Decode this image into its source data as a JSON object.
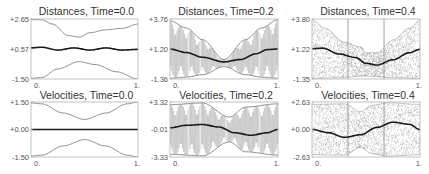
{
  "chart_data": [
    {
      "type": "line",
      "title": "Distances, Time=0.0",
      "xlim": [
        0,
        1
      ],
      "ylim": [
        -1.5,
        2.65
      ],
      "xticks": [
        "0.",
        "1."
      ],
      "yticks": [
        "+2.65",
        "+0.57",
        "-1.50"
      ],
      "yticks_values": [
        2.65,
        0.57,
        -1.5
      ],
      "gridlines_x": [],
      "envelope": {
        "upper": [
          [
            0,
            2.6
          ],
          [
            0.1,
            2.6
          ],
          [
            0.2,
            2.3
          ],
          [
            0.35,
            1.5
          ],
          [
            0.45,
            1.4
          ],
          [
            0.55,
            1.7
          ],
          [
            0.7,
            1.9
          ],
          [
            0.85,
            2.0
          ],
          [
            1,
            2.3
          ]
        ],
        "lower": [
          [
            0,
            -1.45
          ],
          [
            0.1,
            -1.4
          ],
          [
            0.25,
            -0.8
          ],
          [
            0.45,
            -0.3
          ],
          [
            0.6,
            -0.5
          ],
          [
            0.8,
            -1.0
          ],
          [
            1,
            -1.5
          ]
        ]
      },
      "series": [
        {
          "name": "mean",
          "points": [
            [
              0,
              0.65
            ],
            [
              0.1,
              0.7
            ],
            [
              0.25,
              0.5
            ],
            [
              0.4,
              0.65
            ],
            [
              0.55,
              0.5
            ],
            [
              0.7,
              0.65
            ],
            [
              0.85,
              0.5
            ],
            [
              1,
              0.55
            ]
          ]
        }
      ],
      "scatter_density": "none",
      "oscillation": "none"
    },
    {
      "type": "line",
      "title": "Distances, Time=0.2",
      "xlim": [
        0,
        1
      ],
      "ylim": [
        -1.36,
        3.76
      ],
      "xticks": [
        "0.",
        "1."
      ],
      "yticks": [
        "+3.76",
        "+1.20",
        "-1.36"
      ],
      "yticks_values": [
        3.76,
        1.2,
        -1.36
      ],
      "gridlines_x": [],
      "envelope": {
        "upper": [
          [
            0,
            3.6
          ],
          [
            0.15,
            3.0
          ],
          [
            0.3,
            2.0
          ],
          [
            0.5,
            0.3
          ],
          [
            0.7,
            2.0
          ],
          [
            0.85,
            3.0
          ],
          [
            1,
            3.7
          ]
        ],
        "lower": [
          [
            0,
            -1.3
          ],
          [
            0.15,
            -1.2
          ],
          [
            0.3,
            -1.0
          ],
          [
            0.5,
            -0.3
          ],
          [
            0.7,
            -1.0
          ],
          [
            0.85,
            -1.2
          ],
          [
            1,
            -1.3
          ]
        ]
      },
      "series": [
        {
          "name": "mean",
          "points": [
            [
              0,
              1.2
            ],
            [
              0.15,
              0.9
            ],
            [
              0.3,
              0.5
            ],
            [
              0.5,
              0.1
            ],
            [
              0.65,
              0.3
            ],
            [
              0.8,
              0.8
            ],
            [
              0.9,
              1.15
            ],
            [
              1,
              1.2
            ]
          ]
        }
      ],
      "scatter_density": "none",
      "oscillation": "dense"
    },
    {
      "type": "scatter",
      "title": "Distances, Time=0.4",
      "xlim": [
        0,
        1
      ],
      "ylim": [
        -1.35,
        3.8
      ],
      "xticks": [
        "0.",
        "1."
      ],
      "yticks": [
        "+3.80",
        "+1.22",
        "-1.35"
      ],
      "yticks_values": [
        3.8,
        1.22,
        -1.35
      ],
      "gridlines_x": [
        0.333,
        0.667
      ],
      "envelope": {
        "upper": [
          [
            0,
            3.7
          ],
          [
            0.12,
            3.0
          ],
          [
            0.3,
            1.8
          ],
          [
            0.45,
            1.4
          ],
          [
            0.5,
            0.9
          ],
          [
            0.6,
            0.9
          ],
          [
            0.75,
            2.0
          ],
          [
            0.9,
            3.0
          ],
          [
            1,
            3.7
          ]
        ],
        "lower": [
          [
            0,
            -1.3
          ],
          [
            0.2,
            -1.25
          ],
          [
            0.5,
            -1.1
          ],
          [
            0.8,
            -1.25
          ],
          [
            1,
            -1.3
          ]
        ]
      },
      "series": [
        {
          "name": "mean",
          "points": [
            [
              0,
              1.25
            ],
            [
              0.1,
              1.3
            ],
            [
              0.25,
              0.8
            ],
            [
              0.4,
              0.5
            ],
            [
              0.5,
              0.0
            ],
            [
              0.6,
              -0.15
            ],
            [
              0.75,
              0.3
            ],
            [
              0.9,
              0.9
            ],
            [
              1,
              1.2
            ]
          ]
        }
      ],
      "scatter_density": "dense",
      "oscillation": "none"
    },
    {
      "type": "line",
      "title": "Velocities, Time=0.0",
      "xlim": [
        0,
        1
      ],
      "ylim": [
        -1.5,
        1.5
      ],
      "xticks": [
        "0.",
        "1."
      ],
      "yticks": [
        "+1.50",
        "+0.00",
        "-1.50"
      ],
      "yticks_values": [
        1.5,
        0.0,
        -1.5
      ],
      "gridlines_x": [],
      "envelope": {
        "upper": [
          [
            0,
            1.45
          ],
          [
            0.1,
            1.4
          ],
          [
            0.3,
            0.9
          ],
          [
            0.5,
            0.55
          ],
          [
            0.7,
            0.9
          ],
          [
            0.9,
            1.4
          ],
          [
            1,
            1.5
          ]
        ],
        "lower": [
          [
            0,
            -1.45
          ],
          [
            0.1,
            -1.4
          ],
          [
            0.3,
            -0.9
          ],
          [
            0.5,
            -0.55
          ],
          [
            0.7,
            -0.9
          ],
          [
            0.9,
            -1.4
          ],
          [
            1,
            -1.5
          ]
        ]
      },
      "series": [
        {
          "name": "mean",
          "points": [
            [
              0,
              0
            ],
            [
              1,
              0
            ]
          ]
        }
      ],
      "scatter_density": "none",
      "oscillation": "none"
    },
    {
      "type": "line",
      "title": "Velocities, Time=0.2",
      "xlim": [
        0,
        1
      ],
      "ylim": [
        -3.33,
        3.32
      ],
      "xticks": [
        "0.",
        "1."
      ],
      "yticks": [
        "+3.32",
        "-0.01",
        "-3.33"
      ],
      "yticks_values": [
        3.32,
        -0.01,
        -3.33
      ],
      "gridlines_x": [],
      "envelope": {
        "upper": [
          [
            0,
            3.0
          ],
          [
            0.3,
            3.2
          ],
          [
            0.55,
            1.5
          ],
          [
            0.7,
            2.7
          ],
          [
            1,
            3.1
          ]
        ],
        "lower": [
          [
            0,
            -3.0
          ],
          [
            0.3,
            -3.2
          ],
          [
            0.55,
            -1.5
          ],
          [
            0.7,
            -2.7
          ],
          [
            1,
            -3.1
          ]
        ]
      },
      "series": [
        {
          "name": "mean",
          "points": [
            [
              0,
              0.2
            ],
            [
              0.15,
              0.5
            ],
            [
              0.3,
              0.6
            ],
            [
              0.45,
              0.3
            ],
            [
              0.6,
              -0.4
            ],
            [
              0.75,
              -0.7
            ],
            [
              0.9,
              -0.4
            ],
            [
              1,
              0.0
            ]
          ]
        }
      ],
      "scatter_density": "none",
      "oscillation": "dense"
    },
    {
      "type": "scatter",
      "title": "Velocities, Time=0.4",
      "xlim": [
        0,
        1
      ],
      "ylim": [
        -2.63,
        2.63
      ],
      "xticks": [
        "0.",
        "1."
      ],
      "yticks": [
        "+2.63",
        "+0.00",
        "-2.63"
      ],
      "yticks_values": [
        2.63,
        0.0,
        -2.63
      ],
      "gridlines_x": [
        0.333,
        0.667
      ],
      "envelope": {
        "upper": [
          [
            0,
            2.4
          ],
          [
            0.3,
            2.45
          ],
          [
            0.45,
            1.7
          ],
          [
            0.55,
            2.3
          ],
          [
            0.7,
            2.55
          ],
          [
            1,
            2.4
          ]
        ],
        "lower": [
          [
            0,
            -2.4
          ],
          [
            0.3,
            -2.45
          ],
          [
            0.45,
            -1.7
          ],
          [
            0.55,
            -2.3
          ],
          [
            0.7,
            -2.55
          ],
          [
            1,
            -2.4
          ]
        ]
      },
      "series": [
        {
          "name": "mean",
          "points": [
            [
              0,
              0.0
            ],
            [
              0.15,
              -0.3
            ],
            [
              0.3,
              -0.75
            ],
            [
              0.45,
              -0.5
            ],
            [
              0.6,
              0.2
            ],
            [
              0.75,
              0.7
            ],
            [
              0.9,
              0.5
            ],
            [
              1,
              0.0
            ]
          ]
        }
      ],
      "scatter_density": "dense",
      "oscillation": "none"
    }
  ],
  "colors": {
    "frame": "#b3b3b3",
    "envelope": "#8c8c8c",
    "fill_lines": "#9a9a9a",
    "mean": "#1a1a1a",
    "text": "#333333"
  }
}
